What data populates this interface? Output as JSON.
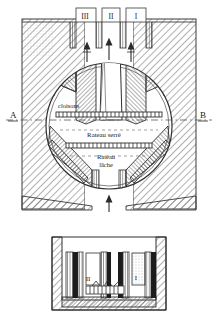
{
  "figure": {
    "title_alt": "Coupe verticale d'un appareil a cloisons et rateaux",
    "background_color": "#ffffff",
    "ink_color": "#2a2a2a",
    "hatch_color": "#6b6b6b"
  },
  "top_labels": [
    {
      "id": "col-III",
      "text": "III",
      "x": 85,
      "y": 16
    },
    {
      "id": "col-II",
      "text": "II",
      "x": 112,
      "y": 15
    },
    {
      "id": "col-I",
      "text": "I",
      "x": 140,
      "y": 15
    }
  ],
  "section_markers": {
    "left": {
      "text": "A",
      "x": 10,
      "y": 117
    },
    "right": {
      "text": "B",
      "x": 203,
      "y": 117
    }
  },
  "annotations": [
    {
      "id": "cloisons",
      "text": "cloisons",
      "x": 58,
      "y": 105
    },
    {
      "id": "rateau-serre",
      "text": "Rateau serré",
      "x": 104,
      "y": 136
    },
    {
      "id": "rateau-lache-1",
      "text": "Rateau",
      "x": 106,
      "y": 158
    },
    {
      "id": "rateau-lache-2",
      "text": "lâche",
      "x": 106,
      "y": 167
    }
  ],
  "bottom_panel_labels": [
    {
      "id": "bay-II",
      "text": "II",
      "x": 86,
      "y": 279
    },
    {
      "id": "bay-I",
      "text": "I",
      "x": 133,
      "y": 278
    }
  ],
  "flow_arrows": [
    {
      "id": "inlet-arrow",
      "direction": "up",
      "x": 109,
      "y": 205
    },
    {
      "id": "central-up-arrow",
      "direction": "up",
      "x": 109,
      "y": 50
    },
    {
      "id": "left-up-arrow",
      "direction": "up",
      "x": 88,
      "y": 52
    },
    {
      "id": "right-up-arrow",
      "direction": "up",
      "x": 131,
      "y": 52
    }
  ]
}
